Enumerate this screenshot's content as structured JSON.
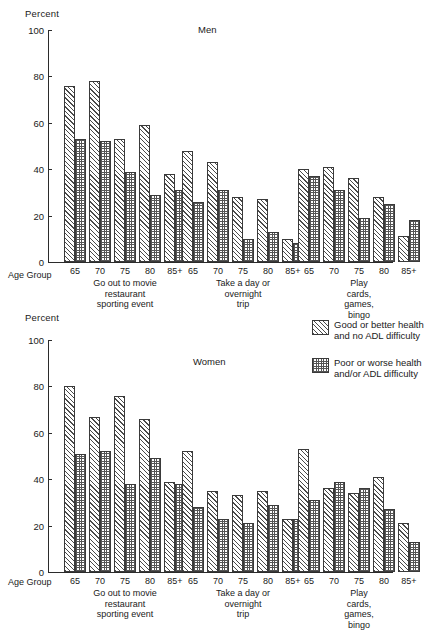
{
  "figure": {
    "y_axis_label": "Percent",
    "age_group_label": "Age Group",
    "panels": [
      "Men",
      "Women"
    ]
  },
  "legend": {
    "position": "top-right-of-women-panel",
    "items": [
      {
        "pattern": "diagonal-hatch",
        "label": "Good or better health\nand no ADL difficulty"
      },
      {
        "pattern": "checkerboard",
        "label": "Poor or worse health\nand/or ADL difficulty"
      }
    ]
  },
  "axis": {
    "yticks": [
      "0",
      "20",
      "40",
      "60",
      "80",
      "100"
    ],
    "ymin": 0,
    "ymax": 100,
    "xticks": [
      "65",
      "70",
      "75",
      "80",
      "85+"
    ]
  },
  "groups": [
    {
      "caption": "Go out to movie\nrestaurant\nsporting event"
    },
    {
      "caption": "Take a day or\novernight\ntrip"
    },
    {
      "caption": "Play cards,\ngames, bingo"
    }
  ],
  "chart_data": {
    "type": "bar",
    "ylabel": "Percent",
    "xlabel": "Age Group",
    "ylim": [
      0,
      100
    ],
    "grid": false,
    "legend_position": "upper right",
    "categories": [
      "65",
      "70",
      "75",
      "80",
      "85+"
    ],
    "group_labels": [
      "Go out to movie restaurant sporting event",
      "Take a day or overnight trip",
      "Play cards, games, bingo"
    ],
    "series_names": [
      "Good or better health and no ADL difficulty",
      "Poor or worse health and/or ADL difficulty"
    ],
    "panels": [
      {
        "name": "Men",
        "groups": [
          {
            "label": "Go out to movie restaurant sporting event",
            "series": [
              {
                "name": "Good or better health and no ADL difficulty",
                "values": [
                  76,
                  78,
                  53,
                  59,
                  38
                ]
              },
              {
                "name": "Poor or worse health and/or ADL difficulty",
                "values": [
                  53,
                  52,
                  39,
                  29,
                  31
                ]
              }
            ]
          },
          {
            "label": "Take a day or overnight trip",
            "series": [
              {
                "name": "Good or better health and no ADL difficulty",
                "values": [
                  48,
                  43,
                  28,
                  27,
                  10
                ]
              },
              {
                "name": "Poor or worse health and/or ADL difficulty",
                "values": [
                  26,
                  31,
                  10,
                  13,
                  8
                ]
              }
            ]
          },
          {
            "label": "Play cards, games, bingo",
            "series": [
              {
                "name": "Good or better health and no ADL difficulty",
                "values": [
                  40,
                  41,
                  36,
                  28,
                  11
                ]
              },
              {
                "name": "Poor or worse health and/or ADL difficulty",
                "values": [
                  37,
                  31,
                  19,
                  25,
                  18
                ]
              }
            ]
          }
        ]
      },
      {
        "name": "Women",
        "groups": [
          {
            "label": "Go out to movie restaurant sporting event",
            "series": [
              {
                "name": "Good or better health and no ADL difficulty",
                "values": [
                  80,
                  67,
                  76,
                  66,
                  39
                ]
              },
              {
                "name": "Poor or worse health and/or ADL difficulty",
                "values": [
                  51,
                  52,
                  38,
                  49,
                  38
                ]
              }
            ]
          },
          {
            "label": "Take a day or overnight trip",
            "series": [
              {
                "name": "Good or better health and no ADL difficulty",
                "values": [
                  52,
                  35,
                  33,
                  35,
                  23
                ]
              },
              {
                "name": "Poor or worse health and/or ADL difficulty",
                "values": [
                  28,
                  23,
                  21,
                  29,
                  23
                ]
              }
            ]
          },
          {
            "label": "Play cards, games, bingo",
            "series": [
              {
                "name": "Good or better health and no ADL difficulty",
                "values": [
                  53,
                  36,
                  34,
                  41,
                  21
                ]
              },
              {
                "name": "Poor or worse health and/or ADL difficulty",
                "values": [
                  31,
                  39,
                  36,
                  27,
                  13
                ]
              }
            ]
          }
        ]
      }
    ]
  }
}
